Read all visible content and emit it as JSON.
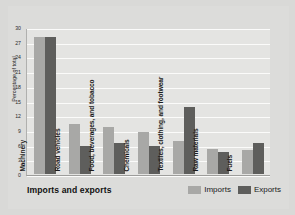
{
  "chart_data": {
    "type": "bar",
    "title": "",
    "xlabel": "Imports and exports",
    "ylabel": "Percentage of total",
    "ylim": [
      0,
      30
    ],
    "ytick_step": 3,
    "yticks": [
      "0",
      "3",
      "6",
      "9",
      "12",
      "15",
      "18",
      "21",
      "24",
      "27",
      "30"
    ],
    "grid": true,
    "legend_position": "bottom-right",
    "categories": [
      "Machinery",
      "Road vehicles",
      "Food, beverages, and tobacco",
      "Chemicals",
      "Textiles, clothing, and footwear",
      "Raw materials",
      "Fuels"
    ],
    "series": [
      {
        "name": "Imports",
        "color": "#a8a8a6",
        "values": [
          28,
          10.2,
          9.6,
          8.6,
          6.7,
          5.2,
          5.0
        ]
      },
      {
        "name": "Exports",
        "color": "#5e5e5c",
        "values": [
          28,
          5.7,
          6.3,
          5.8,
          13.6,
          4.4,
          6.3
        ]
      }
    ]
  },
  "legend": {
    "items": [
      {
        "label": "Imports",
        "color": "#a8a8a6"
      },
      {
        "label": "Exports",
        "color": "#5e5e5c"
      }
    ]
  },
  "colors": {
    "imports": "#a8a8a6",
    "exports": "#5e5e5c",
    "plot_background": "#e4e4e2",
    "page_background": "#d9d9d7",
    "gridline": "#fbfbfa"
  }
}
